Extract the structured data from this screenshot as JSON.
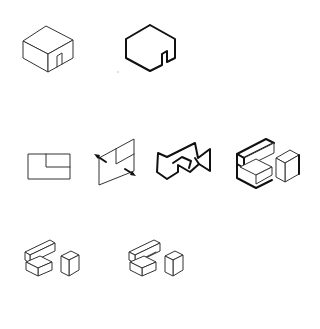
{
  "figure": {
    "background": "#ffffff",
    "line_color": "#222222",
    "rows": [
      {
        "items": [
          {
            "id": "cube-with-door",
            "description": "isometric cube with small door on right face"
          },
          {
            "id": "hexagon-outline-with-notch",
            "description": "bold hexagonal outline with notch"
          }
        ]
      },
      {
        "items": [
          {
            "id": "plan-rectangle",
            "description": "rectangle with inner rectangle in upper-right corner"
          },
          {
            "id": "skewed-plane-with-arrows",
            "description": "oblique plane with two arrows piercing it"
          },
          {
            "id": "interlocking-outline",
            "description": "bold interlocking chevron outline"
          },
          {
            "id": "block-composition-bold",
            "description": "isometric block composition with bold edges"
          }
        ]
      },
      {
        "items": [
          {
            "id": "block-composition-a",
            "description": "isometric stacked blocks"
          },
          {
            "id": "block-composition-b",
            "description": "isometric stacked blocks with overlap"
          }
        ]
      }
    ]
  }
}
